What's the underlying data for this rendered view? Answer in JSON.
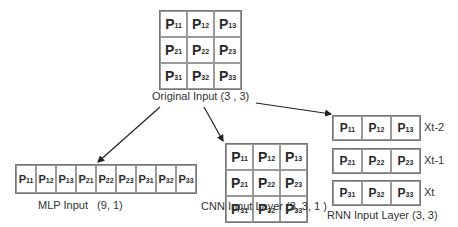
{
  "original": {
    "label": "Original Input  (3 , 3)",
    "cells": [
      [
        "11",
        "12",
        "13"
      ],
      [
        "21",
        "22",
        "23"
      ],
      [
        "31",
        "32",
        "33"
      ]
    ]
  },
  "mlp": {
    "label": "MLP Input   (9, 1)",
    "cells": [
      "11",
      "12",
      "13",
      "21",
      "22",
      "23",
      "31",
      "32",
      "33"
    ]
  },
  "cnn": {
    "label": "CNN Input Layer (3, 3, 1 )",
    "cells": [
      [
        "11",
        "12",
        "13"
      ],
      [
        "21",
        "22",
        "23"
      ],
      [
        "31",
        "32",
        "33"
      ]
    ]
  },
  "rnn": {
    "label": "RNN Input Layer (3, 3)",
    "rows": [
      {
        "cells": [
          "11",
          "12",
          "13"
        ],
        "time_label": "Xt-2"
      },
      {
        "cells": [
          "21",
          "22",
          "23"
        ],
        "time_label": "Xt-1"
      },
      {
        "cells": [
          "31",
          "32",
          "33"
        ],
        "time_label": "Xt"
      }
    ]
  },
  "symbol": "P",
  "colors": {
    "border": "#999999",
    "arrow": "#222222",
    "text": "#2a2a2a"
  }
}
